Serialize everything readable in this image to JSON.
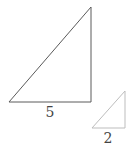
{
  "diagram": {
    "large_triangle": {
      "base_label": "5",
      "stroke_color": "#5a5a5a"
    },
    "small_triangle": {
      "base_label": "2",
      "stroke_color": "#bdbdbd"
    },
    "label_color": "#444444"
  }
}
